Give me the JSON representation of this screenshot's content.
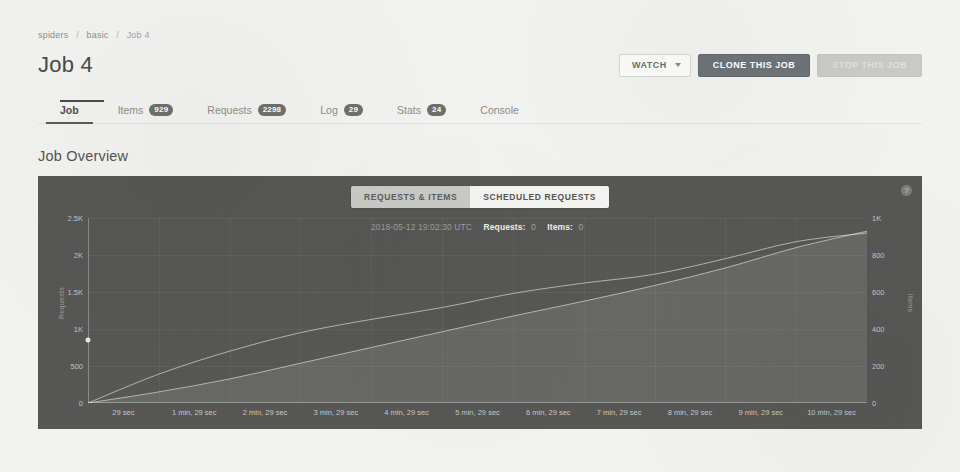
{
  "breadcrumb": {
    "items": [
      "spiders",
      "basic"
    ],
    "current": "Job 4",
    "separator": "/"
  },
  "header": {
    "title": "Job 4",
    "watch_label": "WATCH",
    "clone_label": "CLONE THIS JOB",
    "stop_label": "STOP THIS JOB",
    "stop_disabled": true
  },
  "tabs": [
    {
      "label": "Job",
      "badge": "",
      "active": true
    },
    {
      "label": "Items",
      "badge": "929",
      "active": false
    },
    {
      "label": "Requests",
      "badge": "2298",
      "active": false
    },
    {
      "label": "Log",
      "badge": "29",
      "active": false
    },
    {
      "label": "Stats",
      "badge": "24",
      "active": false
    },
    {
      "label": "Console",
      "badge": "",
      "active": false
    }
  ],
  "section": {
    "title": "Job Overview"
  },
  "chart_panel": {
    "toggle_inactive": "REQUESTS & ITEMS",
    "toggle_active": "SCHEDULED REQUESTS",
    "help_icon_glyph": "?",
    "tooltip": {
      "timestamp": "2018-05-12 19:02:30 UTC",
      "requests_label": "Requests:",
      "requests_value": "0",
      "items_label": "Items:",
      "items_value": "0"
    },
    "background_color": "#565654",
    "line_color": "#ffffff",
    "area_color": "#6d6d6a"
  },
  "chart_data": {
    "type": "line",
    "title": "Job Overview",
    "xlabel": "",
    "ylabel": "Requests",
    "y2label": "Items",
    "grid": true,
    "legend_position": "none",
    "x": [
      0,
      1,
      2,
      3,
      4,
      5,
      6,
      7,
      8,
      9,
      10,
      11
    ],
    "xtick_labels": [
      "29 sec",
      "1 min, 29 sec",
      "2 min, 29 sec",
      "3 min, 29 sec",
      "4 min, 29 sec",
      "5 min, 29 sec",
      "6 min, 29 sec",
      "7 min, 29 sec",
      "8 min, 29 sec",
      "9 min, 29 sec",
      "10 min, 29 sec"
    ],
    "ylim": [
      0,
      2500
    ],
    "ytick_labels": [
      "0",
      "500",
      "1K",
      "1.5K",
      "2K",
      "2.5K"
    ],
    "ytick_values": [
      0,
      500,
      1000,
      1500,
      2000,
      2500
    ],
    "y2lim": [
      0,
      1000
    ],
    "y2tick_labels": [
      "0",
      "200",
      "400",
      "600",
      "800",
      "1K"
    ],
    "y2tick_values": [
      0,
      200,
      400,
      600,
      800,
      1000
    ],
    "series": [
      {
        "name": "Requests",
        "axis": "left",
        "values": [
          0,
          390,
          700,
          950,
          1130,
          1290,
          1480,
          1620,
          1740,
          1950,
          2180,
          2298
        ]
      },
      {
        "name": "Items",
        "axis": "right",
        "values": [
          0,
          60,
          130,
          215,
          300,
          385,
          470,
          550,
          635,
          730,
          840,
          929
        ]
      }
    ]
  }
}
